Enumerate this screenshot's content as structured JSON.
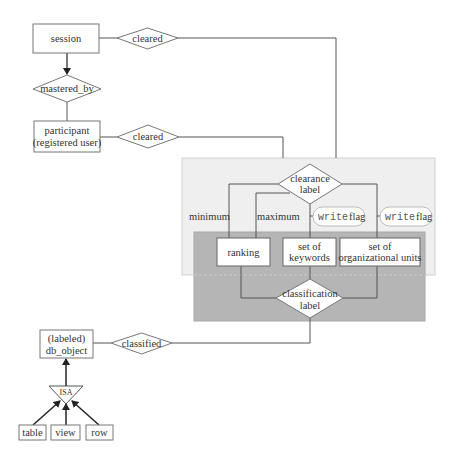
{
  "diagram": {
    "type": "er-diagram",
    "colors": {
      "line": "#555555",
      "box_fill": "#ffffff",
      "upper_region_fill": "#efefef",
      "lower_region_fill": "#b5b5b5"
    },
    "entities": {
      "session": "session",
      "participant_line1": "participant",
      "participant_line2": "(registered user)",
      "ranking": "ranking",
      "keywords_line1": "set of",
      "keywords_line2": "keywords",
      "orgunits_line1": "set of",
      "orgunits_line2": "organizational units",
      "dbobject_line1": "(labeled)",
      "dbobject_line2": "db_object",
      "table": "table",
      "view": "view",
      "row": "row"
    },
    "relationships": {
      "session_cleared": "cleared",
      "mastered_by": "mastered_by",
      "participant_cleared": "cleared",
      "clearance_line1": "clearance",
      "clearance_line2": "label",
      "classification_line1": "classification",
      "classification_line2": "label",
      "classified": "classified",
      "isa": "ISA"
    },
    "edge_labels": {
      "minimum": "minimum",
      "maximum": "maximum",
      "write_flag_1_code": "write",
      "write_flag_1_text": "flag",
      "write_flag_2_code": "write",
      "write_flag_2_text": "flag"
    }
  }
}
